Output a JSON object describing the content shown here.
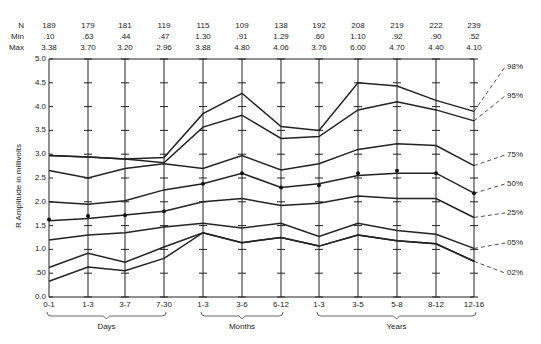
{
  "chart_data": {
    "type": "line",
    "title": "",
    "xlabel": "",
    "ylabel": "R Amplitude in millivolts",
    "ylim": [
      0,
      5.0
    ],
    "yticks": [
      "0.0",
      ".50",
      "1.0",
      "1.5",
      "2.0",
      "2.5",
      "3.0",
      "3.5",
      "4.0",
      "4.5",
      "5.0"
    ],
    "categories": [
      "0-1",
      "1-3",
      "3-7",
      "7-30",
      "1-3",
      "3-6",
      "6-12",
      "1-3",
      "3-5",
      "5-8",
      "8-12",
      "12-16"
    ],
    "groups": [
      {
        "label": "Days",
        "from": 0,
        "to": 3
      },
      {
        "label": "Months",
        "from": 4,
        "to": 6
      },
      {
        "label": "Years",
        "from": 7,
        "to": 11
      }
    ],
    "header_rows": [
      {
        "label": "N",
        "values": [
          "189",
          "179",
          "181",
          "119",
          "115",
          "109",
          "138",
          "192",
          "208",
          "219",
          "222",
          "239"
        ]
      },
      {
        "label": "Min",
        "values": [
          ".10",
          ".63",
          ".44",
          ".47",
          "1.30",
          ".91",
          "1.29",
          ".60",
          "1.10",
          ".92",
          ".90",
          ".52"
        ]
      },
      {
        "label": "Max",
        "values": [
          "3.38",
          "3.70",
          "3.20",
          "2.96",
          "3.88",
          "4.80",
          "4.06",
          "3.76",
          "6.00",
          "4.70",
          "4.40",
          "4.10"
        ]
      }
    ],
    "series": [
      {
        "name": "98%",
        "values": [
          2.97,
          2.94,
          2.9,
          2.93,
          3.85,
          4.28,
          3.58,
          3.5,
          4.5,
          4.43,
          4.13,
          3.9
        ]
      },
      {
        "name": "95%",
        "values": [
          2.97,
          2.94,
          2.9,
          2.82,
          3.57,
          3.82,
          3.33,
          3.37,
          3.93,
          4.1,
          3.93,
          3.7
        ]
      },
      {
        "name": "75%",
        "values": [
          2.66,
          2.5,
          2.7,
          2.8,
          2.7,
          2.97,
          2.67,
          2.8,
          3.1,
          3.22,
          3.18,
          2.76
        ]
      },
      {
        "name": "50%",
        "values": [
          2.0,
          1.95,
          2.02,
          2.25,
          2.38,
          2.6,
          2.3,
          2.38,
          2.55,
          2.6,
          2.6,
          2.18
        ]
      },
      {
        "name": "25%",
        "values": [
          1.6,
          1.65,
          1.72,
          1.8,
          2.0,
          2.07,
          1.92,
          1.97,
          2.12,
          2.07,
          2.07,
          1.67
        ]
      },
      {
        "name": "05%",
        "values": [
          1.2,
          1.3,
          1.35,
          1.47,
          1.55,
          1.45,
          1.55,
          1.27,
          1.55,
          1.4,
          1.32,
          1.02
        ]
      },
      {
        "name": "02%",
        "values": [
          0.62,
          0.92,
          0.73,
          1.05,
          1.35,
          1.14,
          1.25,
          1.07,
          1.3,
          1.18,
          1.12,
          0.75
        ]
      },
      {
        "name": "lowest",
        "values": [
          0.33,
          0.63,
          0.55,
          0.81,
          1.35,
          1.14,
          1.25,
          1.07,
          1.3,
          1.18,
          1.12,
          0.75
        ]
      }
    ],
    "mean_points": [
      1.63,
      1.7,
      1.72,
      1.8,
      2.38,
      2.6,
      2.3,
      2.35,
      2.6,
      2.65,
      2.6,
      2.18
    ],
    "grid": false,
    "legend_position": "right-annotations"
  },
  "labels": {
    "ylabel": "R Amplitude in millivolts",
    "percentiles": [
      "98%",
      "95%",
      "75%",
      "50%",
      "25%",
      "05%",
      "02%"
    ],
    "groups": [
      "Days",
      "Months",
      "Years"
    ]
  }
}
